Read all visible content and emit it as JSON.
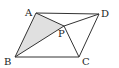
{
  "figure": {
    "type": "parallelogram",
    "labels": {
      "A": "A",
      "B": "B",
      "C": "C",
      "D": "D",
      "P": "P"
    },
    "vertices": {
      "A": [
        36,
        13
      ],
      "D": [
        99,
        14
      ],
      "B": [
        15,
        57
      ],
      "C": [
        79,
        57
      ],
      "P": [
        64,
        26
      ]
    },
    "shaded_region": "triangle ABP",
    "segments": [
      "AB",
      "BC",
      "CD",
      "DA",
      "AP",
      "BP",
      "CP",
      "DP"
    ],
    "colors": {
      "line": "#333333",
      "shade": "#e0e0e0"
    }
  }
}
